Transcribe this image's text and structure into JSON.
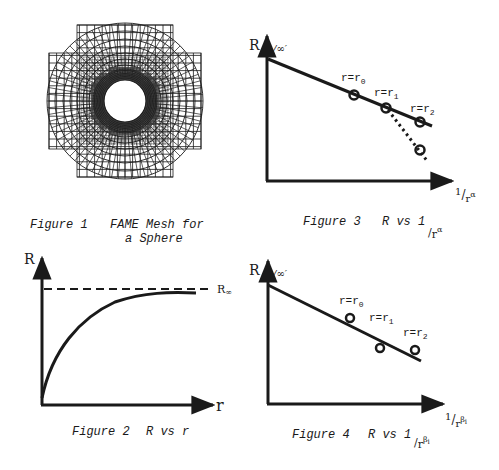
{
  "colors": {
    "ink": "#1a1a1a",
    "background": "#ffffff"
  },
  "figure1": {
    "caption_number": "Figure 1",
    "caption_title_line1": "FAME Mesh for",
    "caption_title_line2": "a Sphere"
  },
  "figure2": {
    "caption_number": "Figure 2",
    "caption_title": "R vs r",
    "y_axis_label": "R",
    "x_axis_label": "r",
    "asymptote_label": "R",
    "asymptote_subscript": "∞"
  },
  "figure3": {
    "caption_number": "Figure 3",
    "caption_title": "R vs 1",
    "caption_denominator": "r",
    "caption_exponent": "α",
    "y_axis_label": "R",
    "y_intercept_label": "∞",
    "x_axis_numerator": "1",
    "x_axis_denominator": "r",
    "x_axis_exponent": "α",
    "points": [
      {
        "label": "r=r",
        "sub": "0"
      },
      {
        "label": "r=r",
        "sub": "1"
      },
      {
        "label": "r=r",
        "sub": "2"
      }
    ]
  },
  "figure4": {
    "caption_number": "Figure 4",
    "caption_title": "R vs 1",
    "caption_denominator": "r",
    "caption_exponent": "β",
    "caption_exponent_sub": "i",
    "y_axis_label": "R",
    "y_intercept_label": "∞",
    "x_axis_numerator": "1",
    "x_axis_denominator": "r",
    "x_axis_exponent": "β",
    "x_axis_exponent_sub": "i",
    "points": [
      {
        "label": "r=r",
        "sub": "0"
      },
      {
        "label": "r=r",
        "sub": "1"
      },
      {
        "label": "r=r",
        "sub": "2"
      }
    ]
  },
  "chart_data": [
    {
      "type": "line",
      "title": "Figure 2  R vs r",
      "xlabel": "r",
      "ylabel": "R",
      "annotations": [
        "R∞ asymptote (dashed horizontal line)"
      ],
      "series": [
        {
          "name": "R(r)",
          "shape": "monotonic increasing curve approaching R∞",
          "x": [
            0,
            0.2,
            0.4,
            0.6,
            0.8,
            1.0
          ],
          "values": [
            0.05,
            0.55,
            0.8,
            0.92,
            0.98,
            1.0
          ]
        },
        {
          "name": "R∞",
          "style": "dashed",
          "x": [
            0,
            1.0
          ],
          "values": [
            1.0,
            1.0
          ]
        }
      ],
      "grid": false
    },
    {
      "type": "line",
      "title": "Figure 3  R vs 1/r^α",
      "xlabel": "1/r^α",
      "ylabel": "R",
      "annotations": [
        "R∞' at y-intercept",
        "r=r0",
        "r=r1",
        "r=r2"
      ],
      "series": [
        {
          "name": "linear fit",
          "style": "solid",
          "x": [
            0,
            0.5,
            0.7,
            0.9
          ],
          "values": [
            1.0,
            0.62,
            0.53,
            0.44
          ]
        },
        {
          "name": "deviation",
          "style": "dotted",
          "x": [
            0.7,
            0.9
          ],
          "values": [
            0.53,
            0.15
          ]
        }
      ],
      "grid": false
    },
    {
      "type": "scatter",
      "title": "Figure 4  R vs 1/r^βi",
      "xlabel": "1/r^βi",
      "ylabel": "R",
      "annotations": [
        "R∞' at y-intercept",
        "r=r0",
        "r=r1",
        "r=r2"
      ],
      "series": [
        {
          "name": "fit line",
          "style": "solid",
          "x": [
            0,
            1.0
          ],
          "values": [
            1.0,
            0.47
          ]
        },
        {
          "name": "data points",
          "style": "open circles",
          "x": [
            0.5,
            0.7,
            0.9
          ],
          "values": [
            0.77,
            0.56,
            0.55
          ]
        }
      ],
      "grid": false
    }
  ]
}
